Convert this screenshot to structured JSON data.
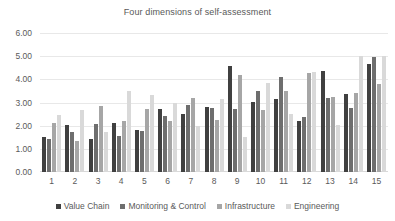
{
  "chart_data": {
    "type": "bar",
    "title": "Four dimensions of self-assessment",
    "xlabel": "",
    "ylabel": "",
    "ylim": [
      0,
      6
    ],
    "ytick_labels": [
      "6.00",
      "5.00",
      "4.00",
      "3.00",
      "2.00",
      "1.00",
      "0.00"
    ],
    "ytick_values": [
      6,
      5,
      4,
      3,
      2,
      1,
      0
    ],
    "grid": true,
    "legend_position": "bottom",
    "categories": [
      "1",
      "2",
      "3",
      "4",
      "5",
      "6",
      "7",
      "8",
      "9",
      "10",
      "11",
      "12",
      "13",
      "14",
      "15"
    ],
    "series": [
      {
        "name": "Value Chain",
        "color": "#404040",
        "values": [
          1.52,
          2.03,
          1.42,
          2.11,
          1.83,
          2.74,
          2.51,
          2.8,
          4.58,
          3.02,
          3.14,
          2.2,
          4.36,
          3.35,
          4.68
        ]
      },
      {
        "name": "Monitoring & Control",
        "color": "#6e6e6e",
        "values": [
          1.44,
          1.74,
          2.08,
          1.57,
          1.76,
          2.41,
          2.88,
          2.75,
          2.71,
          3.48,
          4.08,
          2.39,
          3.19,
          2.76,
          4.97
        ]
      },
      {
        "name": "Infrastructure",
        "color": "#a6a6a6",
        "values": [
          2.1,
          1.32,
          2.85,
          2.22,
          2.74,
          2.22,
          3.18,
          2.23,
          4.18,
          2.67,
          3.48,
          4.28,
          3.24,
          3.39,
          3.82
        ]
      },
      {
        "name": "Engineering",
        "color": "#d9d9d9",
        "values": [
          2.47,
          2.66,
          1.73,
          3.49,
          3.32,
          2.99,
          1.99,
          3.17,
          1.51,
          3.84,
          2.5,
          4.33,
          2.02,
          5.02,
          5.0
        ]
      }
    ]
  }
}
